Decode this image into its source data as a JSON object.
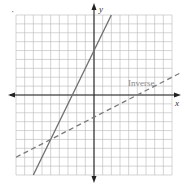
{
  "chart_data": {
    "type": "line",
    "title": "",
    "xlabel": "x",
    "ylabel": "y",
    "xlim": [
      -9,
      9
    ],
    "ylim": [
      -9,
      9
    ],
    "grid": true,
    "grid_step": 1,
    "tick_labels": false,
    "series": [
      {
        "name": "f(x) = 2x + 5",
        "style": "solid",
        "equation": "y = 2x + 5",
        "points": [
          [
            -7,
            -9
          ],
          [
            -2.5,
            0
          ],
          [
            0,
            5
          ],
          [
            2,
            9
          ]
        ]
      },
      {
        "name": "Inverse",
        "style": "dashed",
        "equation": "y = 0.5x - 2.5",
        "points": [
          [
            -9,
            -7
          ],
          [
            -5,
            -5
          ],
          [
            0,
            -2.5
          ],
          [
            5,
            0
          ],
          [
            10,
            2.5
          ]
        ]
      }
    ],
    "annotations": [
      {
        "text": "Inverse",
        "x": 5.9,
        "y": 1.6
      }
    ],
    "intersection": [
      -5,
      -5
    ]
  },
  "labels": {
    "x_axis": "x",
    "y_axis": "y",
    "inverse": "Inverse",
    "corner_mark": "·"
  },
  "colors": {
    "grid": "#b8b8b8",
    "axis": "#222222",
    "solid_line": "#6e6e6e",
    "dashed_line": "#7a7a7a",
    "label": "#8a8a8a"
  }
}
